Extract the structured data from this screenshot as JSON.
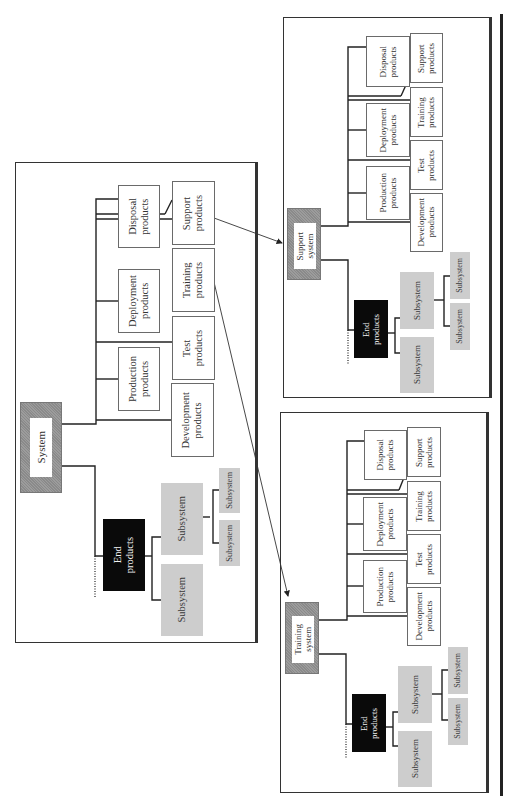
{
  "main": {
    "system_label": "System",
    "end_products_label": "End\nproducts",
    "subsystem_label": "Subsystem",
    "products": {
      "disposal": "Disposal\nproducts",
      "support": "Support\nproducts",
      "training": "Training\nproducts",
      "deployment": "Deployment\nproducts",
      "test": "Test\nproducts",
      "production": "Production\nproducts",
      "development": "Development\nproducts"
    }
  },
  "support_system": {
    "system_label": "Support\nsystem",
    "end_products_label": "End\nproducts",
    "subsystem_label": "Subsystem",
    "products": {
      "disposal": "Disposal\nproducts",
      "support": "Support\nproducts",
      "training": "Training\nproducts",
      "deployment": "Deployment\nproducts",
      "test": "Test\nproducts",
      "production": "Production\nproducts",
      "development": "Development\nproducts"
    }
  },
  "training_system": {
    "system_label": "Training\nsystem",
    "end_products_label": "End\nproducts",
    "subsystem_label": "Subsystem",
    "products": {
      "disposal": "Disposal\nproducts",
      "support": "Support\nproducts",
      "training": "Training\nproducts",
      "deployment": "Deployment\nproducts",
      "test": "Test\nproducts",
      "production": "Production\nproducts",
      "development": "Development\nproducts"
    }
  },
  "colors": {
    "end_products_fill": "#0a0a0a",
    "subsystem_fill": "#cdcdcd",
    "system_frame_fill": "#8e8e8e",
    "border": "#333333"
  },
  "arrows": [
    {
      "from": "main.support_products",
      "to": "support_system"
    },
    {
      "from": "main.training_products",
      "to": "training_system"
    }
  ]
}
